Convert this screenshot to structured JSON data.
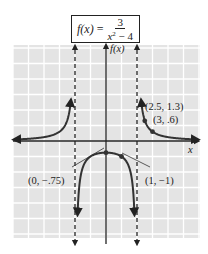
{
  "formula": {
    "lhs": "f(x)",
    "equals": "=",
    "numerator": "3",
    "denominator_var": "x",
    "denominator_exp": "2",
    "denominator_rest": " − 4"
  },
  "axes": {
    "x_label": "x",
    "y_label": "f(x)"
  },
  "points": [
    {
      "label": "(2.5, 1.3)",
      "x": 2.5,
      "y": 1.3
    },
    {
      "label": "(3, .6)",
      "x": 3,
      "y": 0.6
    },
    {
      "label": "(0, −.75)",
      "x": 0,
      "y": -0.75
    },
    {
      "label": "(1, −1)",
      "x": 1,
      "y": -1
    }
  ],
  "asymptotes": {
    "vertical": [
      -2,
      2
    ],
    "horizontal": 0
  },
  "colors": {
    "grid_background": "#e4e4e4",
    "grid_lines": "#ffffff",
    "curve": "#333333",
    "axis": "#222222"
  },
  "chart_data": {
    "type": "line",
    "xlabel": "x",
    "ylabel": "f(x)",
    "xlim": [
      -6,
      6
    ],
    "ylim": [
      -6,
      6
    ],
    "grid": true,
    "vertical_asymptotes": [
      -2,
      2
    ],
    "horizontal_asymptote": 0,
    "labeled_points": [
      {
        "x": 2.5,
        "y": 1.3,
        "label": "(2.5, 1.3)"
      },
      {
        "x": 3,
        "y": 0.6,
        "label": "(3, .6)"
      },
      {
        "x": 0,
        "y": -0.75,
        "label": "(0, −.75)"
      },
      {
        "x": 1,
        "y": -1,
        "label": "(1, −1)"
      }
    ],
    "series": [
      {
        "name": "left branch",
        "x": [
          -6,
          -5,
          -4,
          -3,
          -2.5,
          -2.25
        ],
        "y": [
          0.09,
          0.14,
          0.25,
          0.6,
          1.33,
          2.82
        ]
      },
      {
        "name": "middle branch",
        "x": [
          -1.85,
          -1.5,
          -1,
          0,
          1,
          1.5,
          1.85
        ],
        "y": [
          -5.5,
          -1.71,
          -1,
          -0.75,
          -1,
          -1.71,
          -5.5
        ]
      },
      {
        "name": "right branch",
        "x": [
          2.25,
          2.5,
          3,
          4,
          5,
          6
        ],
        "y": [
          2.82,
          1.33,
          0.6,
          0.25,
          0.14,
          0.09
        ]
      }
    ]
  }
}
